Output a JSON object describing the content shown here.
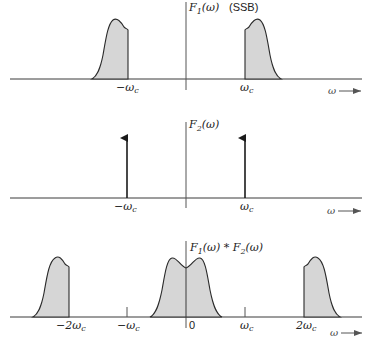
{
  "panels": [
    {
      "id": "f1",
      "title": "F1(ω)",
      "annotation": "(SSB)",
      "axis_label": "ω",
      "ticks": [
        {
          "label": "−ωc",
          "x": 127
        },
        {
          "label": "ωc",
          "x": 245
        }
      ]
    },
    {
      "id": "f2",
      "title": "F2(ω)",
      "axis_label": "ω",
      "ticks": [
        {
          "label": "−ωc",
          "x": 127
        },
        {
          "label": "ωc",
          "x": 245
        }
      ],
      "impulses_at": [
        "−ωc",
        "ωc"
      ]
    },
    {
      "id": "conv",
      "title": "F1(ω) * F2(ω)",
      "axis_label": "ω",
      "ticks": [
        {
          "label": "−2ωc",
          "x": 69
        },
        {
          "label": "−ωc",
          "x": 127
        },
        {
          "label": "0",
          "x": 186
        },
        {
          "label": "ωc",
          "x": 245
        },
        {
          "label": "2ωc",
          "x": 304
        }
      ]
    }
  ],
  "labels": {
    "f1_title_main": "F",
    "f1_title_sub": "1",
    "f1_title_arg": "(ω)",
    "ssb": "(SSB)",
    "f2_title_main": "F",
    "f2_title_sub": "2",
    "f2_title_arg": "(ω)",
    "conv_a_main": "F",
    "conv_a_sub": "1",
    "conv_a_arg": "(ω) * ",
    "conv_b_main": "F",
    "conv_b_sub": "2",
    "conv_b_arg": "(ω)",
    "neg_wc": "−ω",
    "wc": "ω",
    "c": "c",
    "neg_2wc": "−2ω",
    "two_wc": "2ω",
    "zero": "0",
    "omega_arrow": "ω"
  },
  "colors": {
    "fill": "#d6d6d6",
    "stroke": "#2a2a2a",
    "background": "#ffffff"
  }
}
